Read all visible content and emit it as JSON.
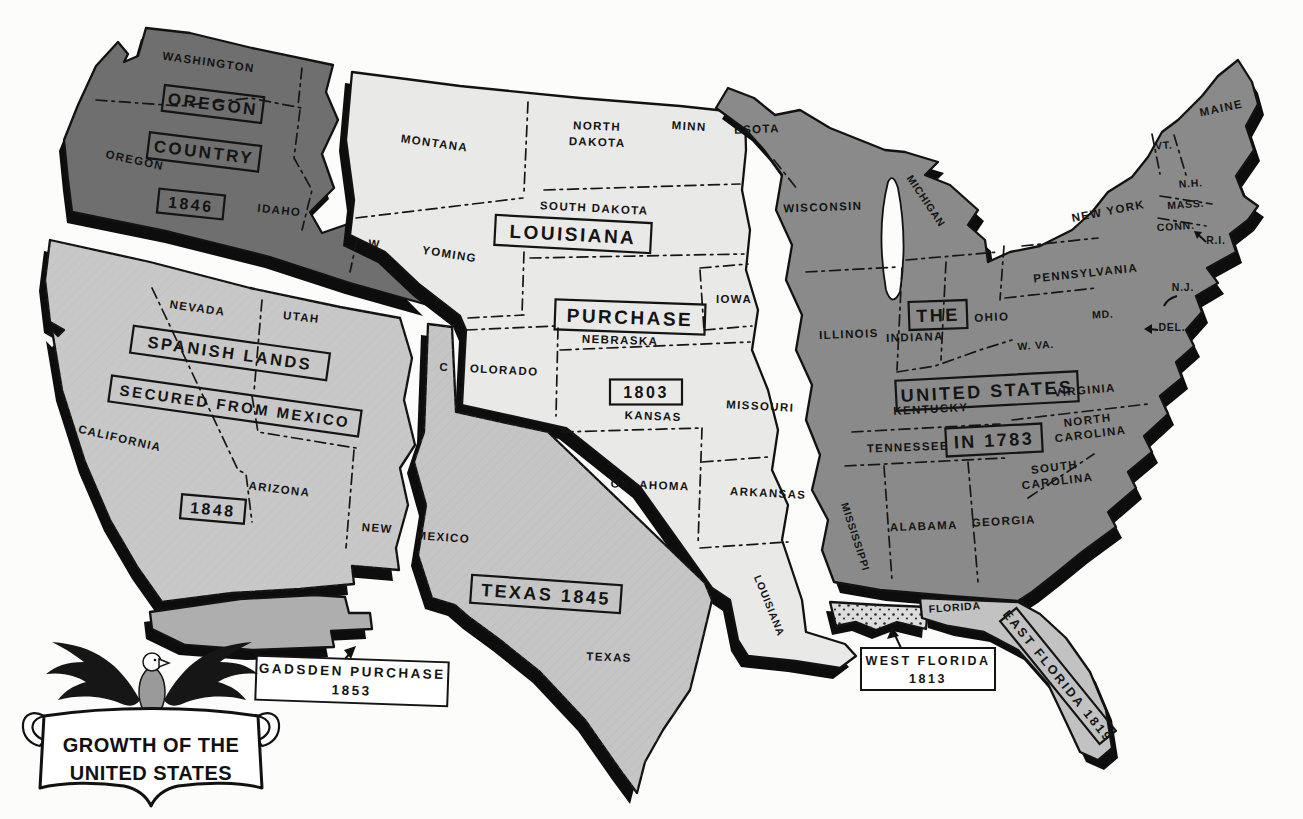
{
  "page": {
    "type": "historical-territorial-map",
    "title": "GROWTH OF THE UNITED STATES"
  },
  "emblem": {
    "icon": "eagle-icon",
    "banner_line1": "GROWTH OF THE",
    "banner_line2": "UNITED STATES"
  },
  "colors": {
    "background": "#fcfcfb",
    "oregon_country": "#6f6f6f",
    "spanish_lands": "#c8c8c8",
    "gadsden_purchase": "#aeaeae",
    "louisiana_purchase": "#e9e9e8",
    "texas": "#c5c5c5",
    "united_states_1783": "#8a8a8a",
    "west_florida": "#dcdcdc",
    "east_florida": "#c2c2c2",
    "outline": "#121212"
  },
  "territories": [
    {
      "name": "OREGON COUNTRY",
      "year": "1846",
      "states": [
        "WASHINGTON",
        "OREGON",
        "IDAHO",
        "W"
      ]
    },
    {
      "name": "SPANISH LANDS SECURED FROM MEXICO",
      "year": "1848",
      "states": [
        "CALIFORNIA",
        "NEVADA",
        "UTAH",
        "ARIZONA",
        "NEW"
      ]
    },
    {
      "name": "GADSDEN PURCHASE",
      "year": "1853",
      "states": []
    },
    {
      "name": "LOUISIANA PURCHASE",
      "year": "1803",
      "states": [
        "MONTANA",
        "NORTH DAKOTA",
        "SOUTH DAKOTA",
        "MINN",
        "YOMING",
        "IOWA",
        "NEBRASKA",
        "OLORADO",
        "KANSAS",
        "MISSOURI",
        "OKLAHOMA",
        "ARKANSAS",
        "LOUISIANA"
      ]
    },
    {
      "name": "TEXAS",
      "year": "1845",
      "states": [
        "C",
        "MEXICO",
        "TEXAS"
      ]
    },
    {
      "name": "THE UNITED STATES IN 1783",
      "year": "1783",
      "states": [
        "ESOTA",
        "WISCONSIN",
        "MICHIGAN",
        "ILLINOIS",
        "INDIANA",
        "OHIO",
        "PENNSYLVANIA",
        "NEW YORK",
        "MAINE",
        "VT.",
        "N.H.",
        "MASS.",
        "CONN.",
        "R.I.",
        "N.J.",
        "MD.",
        "DEL.",
        "W. VA.",
        "VIRGINIA",
        "KENTUCKY",
        "TENNESSEE",
        "NORTH CAROLINA",
        "SOUTH CAROLINA",
        "GEORGIA",
        "ALABAMA",
        "MISSISSIPPI"
      ]
    },
    {
      "name": "WEST FLORIDA",
      "year": "1813",
      "states": []
    },
    {
      "name": "EAST FLORIDA",
      "year": "1819",
      "states": [
        "FLORIDA"
      ]
    }
  ],
  "labels": {
    "washington": "WASHINGTON",
    "oregon_box": "OREGON",
    "country_box": "COUNTRY",
    "year_1846": "1846",
    "oregon_state": "OREGON",
    "idaho": "IDAHO",
    "w_abbrev": "W",
    "nevada": "NEVADA",
    "utah": "UTAH",
    "spanish_lands": "SPANISH LANDS",
    "secured_from_mexico": "SECURED FROM MEXICO",
    "year_1848": "1848",
    "california": "CALIFORNIA",
    "arizona": "ARIZONA",
    "new_abbrev": "NEW",
    "mexico_part": "MEXICO",
    "gadsden_1": "GADSDEN PURCHASE",
    "gadsden_2": "1853",
    "montana": "MONTANA",
    "north_dakota_1": "NORTH",
    "north_dakota_2": "DAKOTA",
    "minn": "MINN",
    "esota": "ESOTA",
    "south_dakota": "SOUTH DAKOTA",
    "louisiana_box": "LOUISIANA",
    "purchase_box": "PURCHASE",
    "year_1803": "1803",
    "yoming": "YOMING",
    "iowa": "IOWA",
    "nebraska": "NEBRASKA",
    "c_abbrev": "C",
    "olorado": "OLORADO",
    "kansas": "KANSAS",
    "missouri": "MISSOURI",
    "oklahoma": "OKLAHOMA",
    "arkansas": "ARKANSAS",
    "louisiana_state": "LOUISIANA",
    "texas_1845": "TEXAS 1845",
    "texas_state": "TEXAS",
    "wisconsin": "WISCONSIN",
    "michigan": "MICHIGAN",
    "the_box": "THE",
    "united_states_box": "UNITED STATES",
    "in_1783_box": "IN 1783",
    "illinois": "ILLINOIS",
    "indiana": "INDIANA",
    "ohio": "OHIO",
    "pennsylvania": "PENNSYLVANIA",
    "new_york": "NEW YORK",
    "maine": "MAINE",
    "vt": "VT.",
    "nh": "N.H.",
    "mass": "MASS.",
    "conn": "CONN.",
    "ri": "R.I.",
    "nj": "N.J.",
    "md": "MD.",
    "del": "DEL.",
    "w_va": "W. VA.",
    "virginia": "VIRGINIA",
    "kentucky": "KENTUCKY",
    "tennessee": "TENNESSEE",
    "north_carolina_1": "NORTH",
    "north_carolina_2": "CAROLINA",
    "south_carolina_1": "SOUTH",
    "south_carolina_2": "CAROLINA",
    "georgia": "GEORGIA",
    "alabama": "ALABAMA",
    "mississippi": "MISSISSIPPI",
    "florida": "FLORIDA",
    "west_florida_1": "WEST FLORIDA",
    "west_florida_2": "1813",
    "east_florida": "EAST FLORIDA 1819",
    "emblem_1": "GROWTH OF THE",
    "emblem_2": "UNITED STATES"
  }
}
